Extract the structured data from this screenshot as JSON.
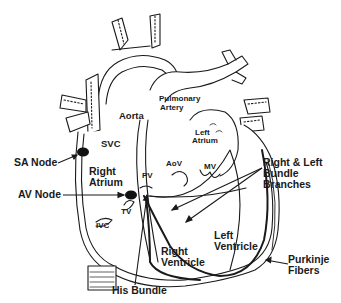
{
  "diagram": {
    "colors": {
      "line": "#1a1a1a",
      "background": "#ffffff"
    },
    "labels": {
      "aorta": "Aorta",
      "pulmonary_artery_1": "Pulmonary",
      "pulmonary_artery_2": "Artery",
      "left_atrium_1": "Left",
      "left_atrium_2": "Atrium",
      "svc": "SVC",
      "sa_node": "SA Node",
      "right_atrium_1": "Right",
      "right_atrium_2": "Atrium",
      "av_node": "AV Node",
      "pv": "PV",
      "aov": "AoV",
      "mv": "MV",
      "tv": "TV",
      "ivc": "IVC",
      "bundle_branches_1": "Right & Left",
      "bundle_branches_2": "Bundle",
      "bundle_branches_3": "Branches",
      "left_ventricle_1": "Left",
      "left_ventricle_2": "Ventricle",
      "right_ventricle_1": "Right",
      "right_ventricle_2": "Ventricle",
      "purkinje_1": "Purkinje",
      "purkinje_2": "Fibers",
      "his_bundle": "His Bundle"
    }
  }
}
